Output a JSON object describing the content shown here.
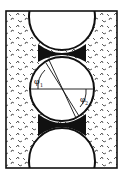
{
  "diagram": {
    "title": "",
    "labels": {
      "phi1": "φ",
      "phi1_sub": "1",
      "phi2": "φ",
      "phi2_sub": "2"
    },
    "colors": {
      "stroke": "#111111",
      "background": "#ffffff",
      "neck_fill": "#111111",
      "matrix_mark": "#333333"
    }
  }
}
